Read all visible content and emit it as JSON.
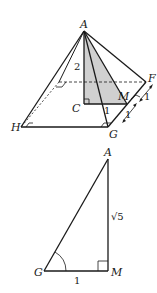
{
  "figures": {
    "pyramid": {
      "points": {
        "A": "A",
        "C": "C",
        "M": "M",
        "F": "F",
        "G": "G",
        "H": "H"
      },
      "labels": {
        "height_AC": "2",
        "length_CM": "1",
        "length_MF": "1",
        "length_GM": "1"
      },
      "shaded_region": "triangle ACM",
      "shade_color": "#d0d0d0",
      "line_color": "#1a1a1a"
    },
    "triangle": {
      "points": {
        "A": "A",
        "G": "G",
        "M": "M"
      },
      "labels": {
        "side_AM": "√5",
        "side_GM": "1"
      },
      "right_angle_at": "M",
      "marked_angle_at": "G"
    }
  }
}
